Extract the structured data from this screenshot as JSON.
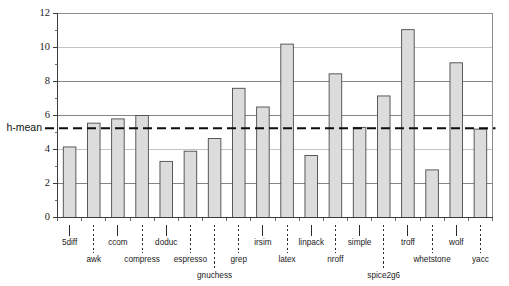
{
  "chart_data": {
    "type": "bar",
    "title": "",
    "subtitle": "",
    "xlabel": "",
    "ylabel": "",
    "ylim": [
      0,
      12
    ],
    "xlim_note": "16 benchmark categories, evenly spaced",
    "grid": true,
    "legend": false,
    "y_ticks_major": [
      0,
      2,
      4,
      6,
      8,
      10,
      12
    ],
    "y_ticks_minor": [
      1,
      3,
      5,
      7,
      9,
      11
    ],
    "y_tick_labels": [
      "0",
      "2",
      "4",
      "6",
      "8",
      "10",
      "12"
    ],
    "categories": [
      "5diff",
      "awk",
      "ccom",
      "compress",
      "doduc",
      "espresso",
      "gnuchess",
      "grep",
      "irsim",
      "latex",
      "linpack",
      "nroff",
      "simple",
      "spice2g6",
      "troff",
      "whetstone",
      "wolf",
      "yacc"
    ],
    "values": [
      4.15,
      5.55,
      5.8,
      6.0,
      3.3,
      3.9,
      4.65,
      7.6,
      6.5,
      10.2,
      3.65,
      8.45,
      5.3,
      7.15,
      11.05,
      2.8,
      9.1,
      5.2
    ],
    "annotations": [
      {
        "name": "h-mean",
        "label": "h-mean",
        "value": 5.25,
        "style": "dashed-horizontal-line"
      }
    ],
    "bar_fill": "#dcdcdc",
    "bar_stroke": "#4a4a4a",
    "hmean_color": "#0d0d0d",
    "grid_color": "#787878",
    "axis_color": "#3c3c3c",
    "label_stagger": "alternating two rows with dotted/solid leader ticks"
  },
  "figure": {
    "background": "#ffffff"
  }
}
